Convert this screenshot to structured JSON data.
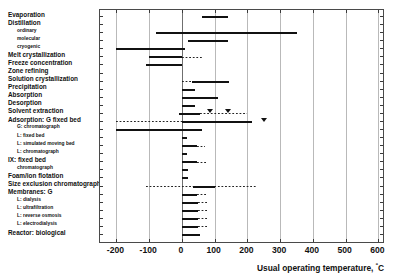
{
  "chart_data": {
    "type": "bar",
    "title": "",
    "subtitle": "",
    "xlabel": "Usual operating temperature, ºC",
    "ylabel": "",
    "xlim": [
      -250,
      620
    ],
    "xticks": [
      -200,
      -100,
      0,
      100,
      200,
      300,
      400,
      500,
      600
    ],
    "xticklabels": [
      "-200",
      "-100",
      "0",
      "100",
      "200",
      "300",
      "400",
      "500",
      "600"
    ],
    "grid": "vertical",
    "legend": "none",
    "orientation": "horizontal",
    "value_unit": "ºC",
    "bar_color": "#111111",
    "grid_color": "#b9b9b9",
    "frame_color": "#4a4a4a",
    "categories": [
      "Evaporation",
      "Distillation",
      "ordinary",
      "molecular",
      "cryogenic",
      "Melt crystallization",
      "Freeze concentration",
      "Zone refining",
      "Solution crystallization",
      "Precipitation",
      "Absorption",
      "Desorption",
      "Solvent extraction",
      "Adsorption: G fixed bed",
      "G: chromatograph",
      "L: fixed bed",
      "L: simulated moving bed",
      "L: chromatograph",
      "IX: fixed bed",
      "chromatograph",
      "Foam/ion flotation",
      "Size exclusion chromatography",
      "Membranes: G",
      "L: dialysis",
      "L: ultrafiltration",
      "L: reverse osmosis",
      "L: electrodialysis",
      "Reactor: biological"
    ],
    "rows": [
      {
        "label": "Evaporation",
        "indent": 0,
        "solid": [
          60,
          140
        ],
        "dotted": [],
        "markers": []
      },
      {
        "label": "Distillation",
        "indent": 0,
        "solid": [],
        "dotted": [],
        "markers": []
      },
      {
        "label": "ordinary",
        "indent": 1,
        "solid": [
          -80,
          350
        ],
        "dotted": [],
        "markers": []
      },
      {
        "label": "molecular",
        "indent": 1,
        "solid": [
          20,
          140
        ],
        "dotted": [],
        "markers": []
      },
      {
        "label": "cryogenic",
        "indent": 1,
        "solid": [
          -200,
          10
        ],
        "dotted": [],
        "markers": []
      },
      {
        "label": "Melt crystallization",
        "indent": 0,
        "solid": [
          -100,
          0
        ],
        "dotted": [
          0,
          60
        ],
        "markers": []
      },
      {
        "label": "Freeze concentration",
        "indent": 0,
        "solid": [
          -110,
          0
        ],
        "dotted": [],
        "markers": []
      },
      {
        "label": "Zone refining",
        "indent": 0,
        "solid": [],
        "dotted": [],
        "markers": []
      },
      {
        "label": "Solution crystallization",
        "indent": 0,
        "solid": [
          30,
          145
        ],
        "dotted": [
          0,
          30
        ],
        "markers": []
      },
      {
        "label": "Precipitation",
        "indent": 0,
        "solid": [
          0,
          40
        ],
        "dotted": [],
        "markers": []
      },
      {
        "label": "Absorption",
        "indent": 0,
        "solid": [
          0,
          110
        ],
        "dotted": [],
        "markers": []
      },
      {
        "label": "Desorption",
        "indent": 0,
        "solid": [
          0,
          40
        ],
        "dotted": [],
        "markers": []
      },
      {
        "label": "Solvent extraction",
        "indent": 0,
        "solid": [
          -10,
          55
        ],
        "dotted": [
          55,
          200
        ],
        "markers": [
          85,
          140
        ]
      },
      {
        "label": "Adsorption: G fixed bed",
        "indent": 0,
        "solid": [
          0,
          215
        ],
        "dotted": [
          -200,
          0
        ],
        "markers": [
          250
        ]
      },
      {
        "label": "G: chromatograph",
        "indent": 1,
        "solid": [
          -200,
          60
        ],
        "dotted": [],
        "markers": []
      },
      {
        "label": "L: fixed bed",
        "indent": 1,
        "solid": [
          0,
          15
        ],
        "dotted": [],
        "markers": []
      },
      {
        "label": "L: simulated moving bed",
        "indent": 1,
        "solid": [
          0,
          45
        ],
        "dotted": [
          45,
          70
        ],
        "markers": []
      },
      {
        "label": "L: chromatograph",
        "indent": 1,
        "solid": [
          0,
          15
        ],
        "dotted": [],
        "markers": []
      },
      {
        "label": "IX: fixed bed",
        "indent": 0,
        "solid": [
          0,
          45
        ],
        "dotted": [
          45,
          75
        ],
        "markers": []
      },
      {
        "label": "chromatograph",
        "indent": 1,
        "solid": [
          0,
          20
        ],
        "dotted": [],
        "markers": []
      },
      {
        "label": "Foam/ion flotation",
        "indent": 0,
        "solid": [
          0,
          18
        ],
        "dotted": [],
        "markers": []
      },
      {
        "label": "Size exclusion chromatography",
        "indent": 0,
        "solid": [
          35,
          100
        ],
        "dotted": [
          -110,
          230
        ],
        "markers": []
      },
      {
        "label": "Membranes: G",
        "indent": 0,
        "solid": [
          0,
          45
        ],
        "dotted": [
          45,
          75
        ],
        "markers": []
      },
      {
        "label": "L: dialysis",
        "indent": 1,
        "solid": [
          0,
          50
        ],
        "dotted": [
          50,
          78
        ],
        "markers": []
      },
      {
        "label": "L: ultrafiltration",
        "indent": 1,
        "solid": [
          0,
          48
        ],
        "dotted": [
          48,
          76
        ],
        "markers": []
      },
      {
        "label": "L: reverse osmosis",
        "indent": 1,
        "solid": [
          0,
          48
        ],
        "dotted": [
          48,
          76
        ],
        "markers": []
      },
      {
        "label": "L: electrodialysis",
        "indent": 1,
        "solid": [
          0,
          48
        ],
        "dotted": [
          48,
          76
        ],
        "markers": []
      },
      {
        "label": "Reactor: biological",
        "indent": 0,
        "solid": [
          0,
          55
        ],
        "dotted": [],
        "markers": []
      }
    ]
  }
}
